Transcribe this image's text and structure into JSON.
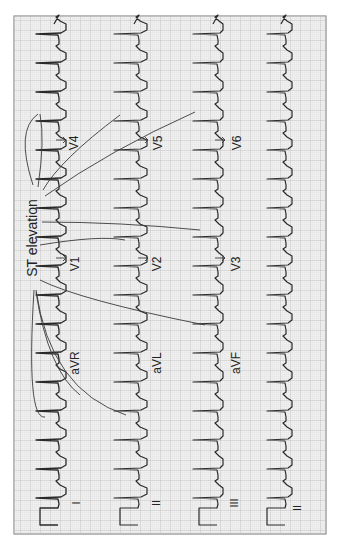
{
  "figure": {
    "title_annotation": "ST elevation",
    "orientation": "rotated-90",
    "paper": {
      "background": "#f1f1f1",
      "minor_grid": "#d6d6d6",
      "major_grid": "#b9b9b9",
      "border": "#777777",
      "trace": "#2a2a2a",
      "callout_line": "#3a3a3a"
    },
    "rows": [
      {
        "leads": [
          "I",
          "aVR",
          "V1",
          "V4"
        ],
        "rhythm_label": "I"
      },
      {
        "leads": [
          "II",
          "aVL",
          "V2",
          "V5"
        ],
        "rhythm_label": "II"
      },
      {
        "leads": [
          "III",
          "aVF",
          "V3",
          "V6"
        ],
        "rhythm_label": "III"
      },
      {
        "leads": [
          "II"
        ],
        "rhythm_label": "II"
      }
    ],
    "lead_labels": {
      "row1": {
        "limb": "I",
        "augmented": "aVR",
        "precordial_a": "V1",
        "precordial_b": "V4"
      },
      "row2": {
        "limb": "II",
        "augmented": "aVL",
        "precordial_a": "V2",
        "precordial_b": "V5"
      },
      "row3": {
        "limb": "III",
        "augmented": "aVF",
        "precordial_a": "V3",
        "precordial_b": "V6"
      },
      "row4": {
        "limb": "II"
      }
    }
  }
}
